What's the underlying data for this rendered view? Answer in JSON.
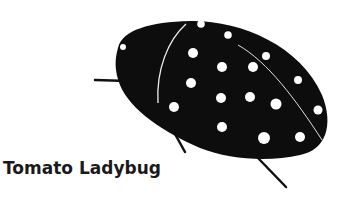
{
  "caption": "Tomato Ladybug",
  "colors": {
    "body": "#0d0d0d",
    "spots": "#ffffff",
    "background": "#ffffff"
  },
  "illustration": {
    "subject": "ladybug",
    "spot_count": 18
  }
}
